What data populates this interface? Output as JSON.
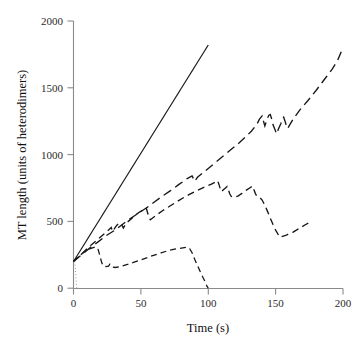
{
  "chart_data": {
    "type": "line",
    "title": "",
    "xlabel": "Time (s)",
    "ylabel": "MT length (units of heterodimers)",
    "xlim": [
      0,
      200
    ],
    "ylim": [
      0,
      2000
    ],
    "xticks": [
      0,
      50,
      100,
      150,
      200
    ],
    "yticks": [
      0,
      500,
      1000,
      1500,
      2000
    ],
    "xtick_labels": [
      "0",
      "50",
      "100",
      "150",
      "200"
    ],
    "ytick_labels": [
      "0",
      "500",
      "1000",
      "1500",
      "2000"
    ],
    "grid": false,
    "legend": "none",
    "legend_position": "none",
    "axis_color": "#8a8a8a",
    "line_color": "#171717",
    "series": [
      {
        "name": "steady-growth-solid",
        "style": "solid",
        "x": [
          0,
          100
        ],
        "y": [
          200,
          1820
        ],
        "points": [
          [
            0,
            200
          ],
          [
            100,
            1820
          ]
        ]
      },
      {
        "name": "dynamic-instability-upper-longdash",
        "style": "long-dash",
        "points": [
          [
            0,
            200
          ],
          [
            6,
            250
          ],
          [
            12,
            300
          ],
          [
            18,
            345
          ],
          [
            24,
            392
          ],
          [
            30,
            430
          ],
          [
            36,
            475
          ],
          [
            42,
            520
          ],
          [
            48,
            560
          ],
          [
            54,
            600
          ],
          [
            60,
            645
          ],
          [
            66,
            690
          ],
          [
            72,
            730
          ],
          [
            78,
            775
          ],
          [
            84,
            818
          ],
          [
            88,
            840
          ],
          [
            90,
            800
          ],
          [
            92,
            830
          ],
          [
            98,
            880
          ],
          [
            104,
            930
          ],
          [
            110,
            980
          ],
          [
            116,
            1030
          ],
          [
            122,
            1080
          ],
          [
            128,
            1135
          ],
          [
            132,
            1175
          ],
          [
            136,
            1225
          ],
          [
            138,
            1265
          ],
          [
            140,
            1290
          ],
          [
            141,
            1250
          ],
          [
            142,
            1215
          ],
          [
            143,
            1245
          ],
          [
            144,
            1275
          ],
          [
            145,
            1295
          ],
          [
            146,
            1300
          ],
          [
            147,
            1270
          ],
          [
            148,
            1225
          ],
          [
            150,
            1175
          ],
          [
            151,
            1155
          ],
          [
            152,
            1190
          ],
          [
            154,
            1235
          ],
          [
            155,
            1265
          ],
          [
            156,
            1280
          ],
          [
            157,
            1250
          ],
          [
            158,
            1215
          ],
          [
            159,
            1195
          ],
          [
            160,
            1215
          ],
          [
            163,
            1265
          ],
          [
            168,
            1335
          ],
          [
            174,
            1405
          ],
          [
            180,
            1480
          ],
          [
            186,
            1560
          ],
          [
            192,
            1640
          ],
          [
            196,
            1705
          ],
          [
            200,
            1800
          ]
        ]
      },
      {
        "name": "dynamic-instability-middle-meddash",
        "style": "medium-dash",
        "points": [
          [
            0,
            200
          ],
          [
            5,
            245
          ],
          [
            10,
            295
          ],
          [
            14,
            330
          ],
          [
            18,
            365
          ],
          [
            22,
            400
          ],
          [
            26,
            435
          ],
          [
            28,
            455
          ],
          [
            29,
            425
          ],
          [
            30,
            440
          ],
          [
            32,
            470
          ],
          [
            34,
            490
          ],
          [
            36,
            470
          ],
          [
            37,
            450
          ],
          [
            38,
            468
          ],
          [
            40,
            495
          ],
          [
            43,
            520
          ],
          [
            46,
            548
          ],
          [
            49,
            570
          ],
          [
            52,
            588
          ],
          [
            54,
            600
          ],
          [
            55,
            565
          ],
          [
            56,
            530
          ],
          [
            57,
            512
          ],
          [
            58,
            520
          ],
          [
            62,
            550
          ],
          [
            66,
            580
          ],
          [
            70,
            605
          ],
          [
            74,
            630
          ],
          [
            78,
            655
          ],
          [
            82,
            680
          ],
          [
            86,
            702
          ],
          [
            90,
            723
          ],
          [
            94,
            742
          ],
          [
            98,
            760
          ],
          [
            102,
            778
          ],
          [
            105,
            792
          ],
          [
            107,
            805
          ],
          [
            108,
            775
          ],
          [
            109,
            742
          ],
          [
            110,
            722
          ],
          [
            111,
            735
          ],
          [
            113,
            752
          ],
          [
            114,
            762
          ],
          [
            115,
            735
          ],
          [
            116,
            705
          ],
          [
            117,
            688
          ],
          [
            119,
            680
          ],
          [
            122,
            690
          ],
          [
            125,
            710
          ],
          [
            128,
            732
          ],
          [
            131,
            752
          ],
          [
            133,
            765
          ],
          [
            134,
            735
          ],
          [
            135,
            708
          ],
          [
            136,
            690
          ],
          [
            138,
            682
          ],
          [
            140,
            660
          ],
          [
            142,
            620
          ],
          [
            144,
            575
          ],
          [
            146,
            525
          ],
          [
            148,
            478
          ],
          [
            150,
            435
          ],
          [
            152,
            400
          ],
          [
            153,
            382
          ],
          [
            158,
            398
          ],
          [
            163,
            420
          ],
          [
            168,
            450
          ],
          [
            172,
            475
          ],
          [
            175,
            492
          ]
        ]
      },
      {
        "name": "bounded-growth-lower-shortdash",
        "style": "short-dash",
        "points": [
          [
            0,
            200
          ],
          [
            4,
            240
          ],
          [
            8,
            272
          ],
          [
            12,
            295
          ],
          [
            16,
            308
          ],
          [
            18,
            300
          ],
          [
            19,
            265
          ],
          [
            20,
            225
          ],
          [
            21,
            190
          ],
          [
            22,
            168
          ],
          [
            24,
            162
          ],
          [
            26,
            165
          ],
          [
            27,
            180
          ],
          [
            28,
            172
          ],
          [
            29,
            158
          ],
          [
            31,
            155
          ],
          [
            35,
            163
          ],
          [
            40,
            178
          ],
          [
            45,
            195
          ],
          [
            50,
            212
          ],
          [
            55,
            230
          ],
          [
            60,
            248
          ],
          [
            65,
            265
          ],
          [
            70,
            280
          ],
          [
            75,
            292
          ],
          [
            80,
            300
          ],
          [
            84,
            306
          ],
          [
            86,
            300
          ],
          [
            88,
            265
          ],
          [
            90,
            215
          ],
          [
            92,
            170
          ],
          [
            94,
            125
          ],
          [
            96,
            82
          ],
          [
            98,
            42
          ],
          [
            99,
            15
          ],
          [
            100,
            0
          ]
        ]
      },
      {
        "name": "initial-nucleation-dotted",
        "style": "dotted",
        "points": [
          [
            1,
            200
          ],
          [
            1.5,
            120
          ],
          [
            2,
            45
          ],
          [
            2.5,
            0
          ]
        ]
      }
    ]
  },
  "axes": {
    "y_axis_title": "MT length (units of heterodimers)",
    "x_axis_title": "Time (s)"
  }
}
